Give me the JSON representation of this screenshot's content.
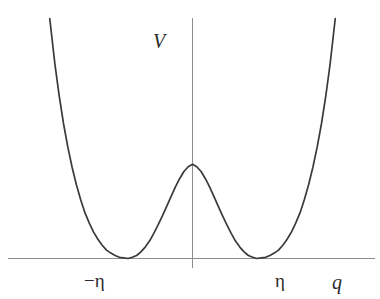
{
  "figure": {
    "background_color": "#ffffff",
    "curve_color": "#3a3a3a",
    "axis_color": "#8e8e8e",
    "label_color": "#2b2b2b"
  },
  "labels": {
    "y_axis": "V",
    "x_axis": "q",
    "tick_left": "−η",
    "tick_right": "η"
  },
  "chart_data": {
    "type": "line",
    "title": "",
    "xlabel": "q",
    "ylabel": "V",
    "grid": false,
    "legend": null,
    "annotations": [
      {
        "text": "−η",
        "x": -1,
        "y": 0,
        "note": "left minimum, V = 0"
      },
      {
        "text": "η",
        "x": 1,
        "y": 0,
        "note": "right minimum, V = 0"
      }
    ],
    "axes": {
      "x_axis_drawn": true,
      "y_axis_drawn": true,
      "x_ticks": [
        -1,
        1
      ],
      "x_tick_labels": [
        "−η",
        "η"
      ],
      "y_ticks": [],
      "y_tick_labels": [],
      "xlim": [
        -1.66,
        1.66
      ],
      "ylim": [
        -0.1,
        4.0
      ]
    },
    "function": "V(q) = (lambda/4)(q^2 - eta^2)^2  — symmetric double-well (Mexican-hat) potential",
    "series": [
      {
        "name": "V(q)",
        "x": [
          -1.66,
          -1.6,
          -1.55,
          -1.5,
          -1.45,
          -1.4,
          -1.35,
          -1.3,
          -1.25,
          -1.2,
          -1.15,
          -1.1,
          -1.05,
          -1.0,
          -0.95,
          -0.9,
          -0.85,
          -0.8,
          -0.75,
          -0.7,
          -0.65,
          -0.6,
          -0.55,
          -0.5,
          -0.45,
          -0.4,
          -0.35,
          -0.3,
          -0.25,
          -0.2,
          -0.15,
          -0.1,
          -0.05,
          0.0,
          0.05,
          0.1,
          0.15,
          0.2,
          0.25,
          0.3,
          0.35,
          0.4,
          0.45,
          0.5,
          0.55,
          0.6,
          0.65,
          0.7,
          0.75,
          0.8,
          0.85,
          0.9,
          0.95,
          1.0,
          1.05,
          1.1,
          1.15,
          1.2,
          1.25,
          1.3,
          1.35,
          1.4,
          1.45,
          1.5,
          1.55,
          1.6,
          1.66
        ],
        "y": [
          4.0,
          3.24,
          2.71,
          2.25,
          1.86,
          1.52,
          1.23,
          0.98,
          0.76,
          0.59,
          0.44,
          0.32,
          0.22,
          0.14,
          0.09,
          0.05,
          0.02,
          0.01,
          0.0,
          0.02,
          0.05,
          0.11,
          0.19,
          0.29,
          0.42,
          0.56,
          0.71,
          0.87,
          1.03,
          1.19,
          1.33,
          1.45,
          1.53,
          1.57,
          1.53,
          1.45,
          1.33,
          1.19,
          1.03,
          0.87,
          0.71,
          0.56,
          0.42,
          0.29,
          0.19,
          0.11,
          0.05,
          0.02,
          0.0,
          0.01,
          0.02,
          0.05,
          0.09,
          0.14,
          0.22,
          0.32,
          0.44,
          0.59,
          0.76,
          0.98,
          1.23,
          1.52,
          1.86,
          2.25,
          2.71,
          3.24,
          4.0
        ],
        "maximum": {
          "x": 0,
          "y": 1.57
        },
        "minima": [
          {
            "x": -1,
            "y": 0
          },
          {
            "x": 1,
            "y": 0
          }
        ]
      }
    ]
  }
}
